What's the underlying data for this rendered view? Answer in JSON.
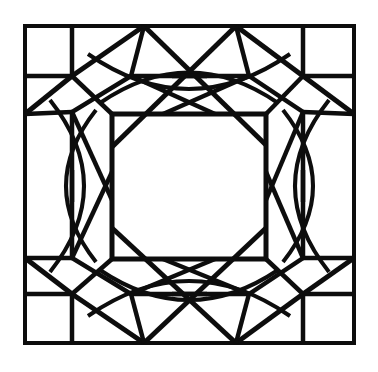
{
  "figure": {
    "title": "Geometric Quilt Block Pattern",
    "type": "line-drawing",
    "background_color": "#ffffff",
    "line_color": "#0d0d0d",
    "canvas": {
      "width": 378,
      "height": 372
    },
    "stroke_widths": {
      "outer_frame": 4,
      "main": 5,
      "thin": 3.5
    },
    "geometry": {
      "outer_frame": {
        "x1": 25,
        "y1": 26,
        "x2": 354,
        "y2": 343
      },
      "corner_square_size": {
        "width": 47,
        "height": 50
      },
      "corner_squares": [
        {
          "name": "top-left",
          "x1": 25,
          "y1": 26,
          "x2": 72,
          "y2": 76
        },
        {
          "name": "top-right",
          "x1": 303,
          "y1": 26,
          "x2": 354,
          "y2": 76
        },
        {
          "name": "bottom-left",
          "x1": 25,
          "y1": 294,
          "x2": 72,
          "y2": 343
        },
        {
          "name": "bottom-right",
          "x1": 303,
          "y1": 294,
          "x2": 354,
          "y2": 343
        }
      ],
      "inner_square": {
        "x1": 112,
        "y1": 114,
        "x2": 266,
        "y2": 259
      },
      "octagon_notch_points": {
        "top_left_x": 131,
        "top_right_x": 249,
        "left_top_y": 112,
        "left_bottom_y": 258,
        "right_top_y": 112,
        "right_bottom_y": 258
      },
      "band_inner_offsets": {
        "top": 76,
        "bottom": 294,
        "left": 72,
        "right": 303
      },
      "center": {
        "x": 189,
        "y": 186
      }
    },
    "elements": [
      {
        "name": "outer-frame",
        "kind": "rect"
      },
      {
        "name": "corner-square-top-left",
        "kind": "rect"
      },
      {
        "name": "corner-square-top-right",
        "kind": "rect"
      },
      {
        "name": "corner-square-bottom-left",
        "kind": "rect"
      },
      {
        "name": "corner-square-bottom-right",
        "kind": "rect"
      },
      {
        "name": "inner-center-square",
        "kind": "rect"
      },
      {
        "name": "corner-diagonal-top-left",
        "kind": "line"
      },
      {
        "name": "corner-diagonal-top-right",
        "kind": "line"
      },
      {
        "name": "corner-diagonal-bottom-left",
        "kind": "line"
      },
      {
        "name": "corner-diagonal-bottom-right",
        "kind": "line"
      },
      {
        "name": "arc-band-top",
        "kind": "arc"
      },
      {
        "name": "arc-band-bottom",
        "kind": "arc"
      },
      {
        "name": "arc-band-left",
        "kind": "arc"
      },
      {
        "name": "arc-band-right",
        "kind": "arc"
      },
      {
        "name": "crossing-x-top",
        "kind": "crossing"
      },
      {
        "name": "crossing-x-bottom",
        "kind": "crossing"
      },
      {
        "name": "crossing-x-left",
        "kind": "crossing"
      },
      {
        "name": "crossing-x-right",
        "kind": "crossing"
      }
    ]
  }
}
